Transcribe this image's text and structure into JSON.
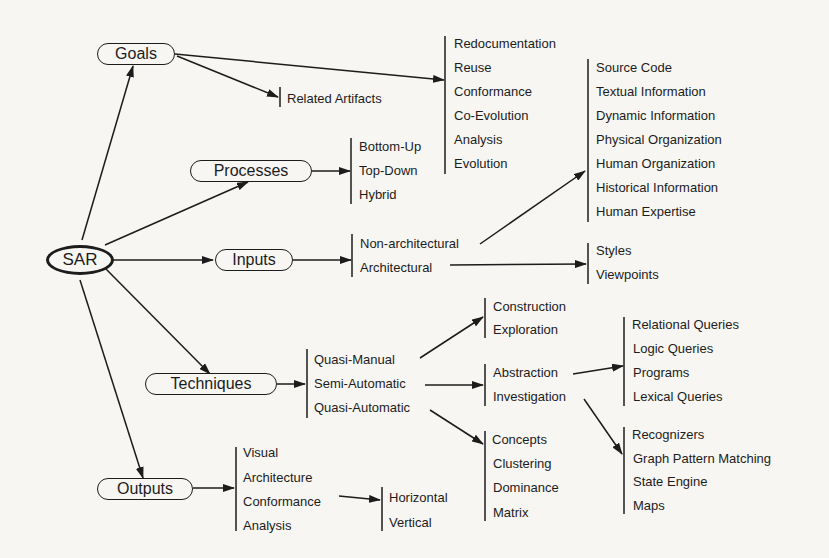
{
  "diagram": {
    "root": "SAR",
    "branches": {
      "goals": {
        "label": "Goals",
        "related": "Related Artifacts",
        "items": [
          "Redocumentation",
          "Reuse",
          "Conformance",
          "Co-Evolution",
          "Analysis",
          "Evolution"
        ]
      },
      "processes": {
        "label": "Processes",
        "items": [
          "Bottom-Up",
          "Top-Down",
          "Hybrid"
        ]
      },
      "inputs": {
        "label": "Inputs",
        "items": [
          "Non-architectural",
          "Architectural"
        ],
        "non_arch_items": [
          "Source Code",
          "Textual Information",
          "Dynamic Information",
          "Physical Organization",
          "Human Organization",
          "Historical Information",
          "Human Expertise"
        ],
        "arch_items": [
          "Styles",
          "Viewpoints"
        ]
      },
      "techniques": {
        "label": "Techniques",
        "items": [
          "Quasi-Manual",
          "Semi-Automatic",
          "Quasi-Automatic"
        ],
        "manual_items": [
          "Construction",
          "Exploration"
        ],
        "semi_items": [
          "Abstraction",
          "Investigation"
        ],
        "abstraction_items": [
          "Relational Queries",
          "Logic Queries",
          "Programs",
          "Lexical Queries"
        ],
        "investigation_items": [
          "Recognizers",
          "Graph Pattern Matching",
          "State Engine",
          "Maps"
        ],
        "auto_items": [
          "Concepts",
          "Clustering",
          "Dominance",
          "Matrix"
        ]
      },
      "outputs": {
        "label": "Outputs",
        "items": [
          "Visual",
          "Architecture",
          "Conformance",
          "Analysis"
        ],
        "conformance_items": [
          "Horizontal",
          "Vertical"
        ]
      }
    }
  }
}
